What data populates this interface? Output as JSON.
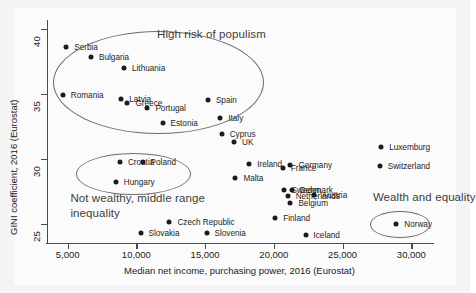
{
  "chart_data": {
    "type": "scatter",
    "title": "",
    "xlabel": "Median net income, purchasing power, 2016 (Eurostat)",
    "ylabel": "GINI coefficient, 2016 (Eurostat)",
    "xlim": [
      3500,
      31500
    ],
    "ylim": [
      23.5,
      40.5
    ],
    "xticks": [
      5000,
      10000,
      15000,
      20000,
      25000,
      30000
    ],
    "xtick_labels": [
      "5,000",
      "10,000",
      "15,000",
      "20,000",
      "25,000",
      "30,000"
    ],
    "yticks": [
      25,
      30,
      35,
      40
    ],
    "ytick_labels": [
      "25",
      "30",
      "35",
      "40"
    ],
    "grid": false,
    "legend": "none",
    "points": [
      {
        "label": "Serbia",
        "x": 4900,
        "y": 38.6,
        "lx": 8,
        "ly": 0
      },
      {
        "label": "Bulgaria",
        "x": 6700,
        "y": 37.8,
        "lx": 8,
        "ly": 0
      },
      {
        "label": "Lithuania",
        "x": 9100,
        "y": 37.0,
        "lx": 8,
        "ly": 0
      },
      {
        "label": "Romania",
        "x": 4650,
        "y": 34.9,
        "lx": 8,
        "ly": 0
      },
      {
        "label": "Latvia",
        "x": 8900,
        "y": 34.6,
        "lx": 8,
        "ly": 0
      },
      {
        "label": "Greece",
        "x": 9350,
        "y": 34.3,
        "lx": 8,
        "ly": 0
      },
      {
        "label": "Portugal",
        "x": 10800,
        "y": 33.9,
        "lx": 8,
        "ly": 0
      },
      {
        "label": "Spain",
        "x": 15200,
        "y": 34.5,
        "lx": 8,
        "ly": 0
      },
      {
        "label": "Estonia",
        "x": 11900,
        "y": 32.7,
        "lx": 8,
        "ly": 0
      },
      {
        "label": "Italy",
        "x": 16100,
        "y": 33.1,
        "lx": 8,
        "ly": 0
      },
      {
        "label": "Cyprus",
        "x": 16200,
        "y": 31.9,
        "lx": 8,
        "ly": 0
      },
      {
        "label": "UK",
        "x": 17100,
        "y": 31.3,
        "lx": 8,
        "ly": 0
      },
      {
        "label": "Luxemburg",
        "x": 27800,
        "y": 30.9,
        "lx": 8,
        "ly": 0
      },
      {
        "label": "Croatia",
        "x": 8800,
        "y": 29.7,
        "lx": 8,
        "ly": 0
      },
      {
        "label": "Poland",
        "x": 10450,
        "y": 29.7,
        "lx": 8,
        "ly": 0
      },
      {
        "label": "Ireland",
        "x": 18200,
        "y": 29.6,
        "lx": 8,
        "ly": 0
      },
      {
        "label": "France",
        "x": 20650,
        "y": 29.3,
        "lx": 8,
        "ly": 0
      },
      {
        "label": "Germany",
        "x": 21200,
        "y": 29.5,
        "lx": 8,
        "ly": 0
      },
      {
        "label": "Switzerland",
        "x": 27700,
        "y": 29.4,
        "lx": 8,
        "ly": 0
      },
      {
        "label": "Malta",
        "x": 17200,
        "y": 28.5,
        "lx": 8,
        "ly": 0
      },
      {
        "label": "Hungary",
        "x": 8500,
        "y": 28.2,
        "lx": 8,
        "ly": 0
      },
      {
        "label": "Sweden",
        "x": 20700,
        "y": 27.6,
        "lx": 8,
        "ly": 0
      },
      {
        "label": "Denmark",
        "x": 21300,
        "y": 27.6,
        "lx": 8,
        "ly": 0
      },
      {
        "label": "Austria",
        "x": 22900,
        "y": 27.2,
        "lx": 8,
        "ly": 0
      },
      {
        "label": "Netherlands",
        "x": 21000,
        "y": 27.1,
        "lx": 8,
        "ly": 0
      },
      {
        "label": "Belgium",
        "x": 21200,
        "y": 26.6,
        "lx": 8,
        "ly": 0
      },
      {
        "label": "Finland",
        "x": 20100,
        "y": 25.4,
        "lx": 8,
        "ly": 0
      },
      {
        "label": "Norway",
        "x": 28900,
        "y": 25.0,
        "lx": 8,
        "ly": 0
      },
      {
        "label": "Czech Republic",
        "x": 12400,
        "y": 25.1,
        "lx": 8,
        "ly": 0
      },
      {
        "label": "Slovakia",
        "x": 10300,
        "y": 24.3,
        "lx": 8,
        "ly": 0
      },
      {
        "label": "Slovenia",
        "x": 15100,
        "y": 24.3,
        "lx": 8,
        "ly": 0
      },
      {
        "label": "Iceland",
        "x": 22300,
        "y": 24.1,
        "lx": 8,
        "ly": 0
      }
    ],
    "annotations": [
      {
        "text": "High risk of populism",
        "x": 11500,
        "y": 39.4
      },
      {
        "text": "Not wealthy, middle range inequality",
        "x": 5200,
        "y": 26.9
      },
      {
        "text": "Wealth and equality",
        "x": 27200,
        "y": 26.9
      }
    ],
    "ellipses": [
      {
        "name": "high-risk-of-populism-ellipse",
        "cx": 11500,
        "cy": 35.9,
        "rx": 7600,
        "ry": 3.9
      },
      {
        "name": "middle-inequality-ellipse",
        "cx": 9700,
        "cy": 28.9,
        "rx": 4100,
        "ry": 1.55
      },
      {
        "name": "wealth-and-equality-ellipse",
        "cx": 29100,
        "cy": 25.0,
        "rx": 2100,
        "ry": 0.95
      }
    ]
  },
  "colors": {
    "point": "#1b1b1b",
    "axis": "#4a4a4a",
    "ellipse": "#6d6d6d",
    "annotation": "#3d3d3d",
    "background": "#f4f4f4",
    "canvas": "#fbfbfb"
  }
}
